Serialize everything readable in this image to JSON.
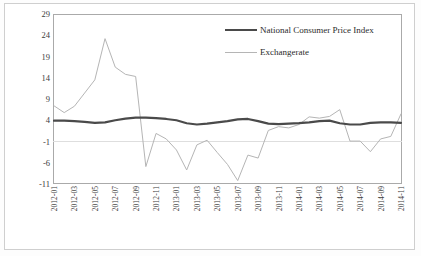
{
  "figure": {
    "background_color": "#ffffff",
    "frame_color": "#aaaaaa"
  },
  "legend": {
    "position": "top-right",
    "entries": [
      {
        "label": "National Consumer Price Index",
        "color": "#4a4a4a",
        "width": 2.2
      },
      {
        "label": "Exchangerate",
        "color": "#b5b5b5",
        "width": 1.0
      }
    ]
  },
  "chart_data": {
    "type": "line",
    "title": "",
    "subtitle": "",
    "xlabel": "",
    "ylabel": "Annual variation",
    "ylim": [
      -11,
      29
    ],
    "yticks": [
      29,
      24,
      19,
      14,
      9,
      4,
      -1,
      -6,
      -11
    ],
    "grid": "horizontal-single-at--1",
    "gridlines": [
      -1
    ],
    "legend_position": "top-right",
    "x": [
      "2012-01",
      "2012-02",
      "2012-03",
      "2012-04",
      "2012-05",
      "2012-06",
      "2012-07",
      "2012-08",
      "2012-09",
      "2012-10",
      "2012-11",
      "2012-12",
      "2013-01",
      "2013-02",
      "2013-03",
      "2013-04",
      "2013-05",
      "2013-06",
      "2013-07",
      "2013-08",
      "2013-09",
      "2013-10",
      "2013-11",
      "2013-12",
      "2014-01",
      "2014-02",
      "2014-03",
      "2014-04",
      "2014-05",
      "2014-06",
      "2014-07",
      "2014-08",
      "2014-09",
      "2014-10",
      "2014-11"
    ],
    "xticklabels": [
      "2012-01",
      "2012-03",
      "2012-05",
      "2012-07",
      "2012-09",
      "2012-11",
      "2013-01",
      "2013-03",
      "2013-05",
      "2013-07",
      "2013-09",
      "2013-11",
      "2014-01",
      "2014-03",
      "2014-05",
      "2014-07",
      "2014-09",
      "2014-11"
    ],
    "xtick_indices": [
      0,
      2,
      4,
      6,
      8,
      10,
      12,
      14,
      16,
      18,
      20,
      22,
      24,
      26,
      28,
      30,
      32,
      34
    ],
    "series": [
      {
        "name": "National Consumer Price Index",
        "color": "#4a4a4a",
        "width": 2.2,
        "values": [
          3.9,
          3.9,
          3.8,
          3.6,
          3.4,
          3.5,
          4.0,
          4.4,
          4.6,
          4.6,
          4.5,
          4.3,
          4.0,
          3.3,
          3.0,
          3.2,
          3.5,
          3.8,
          4.2,
          4.3,
          3.8,
          3.2,
          3.1,
          3.2,
          3.3,
          3.5,
          3.8,
          3.9,
          3.3,
          3.0,
          3.0,
          3.4,
          3.5,
          3.5,
          3.4
        ]
      },
      {
        "name": "Exchangerate",
        "color": "#b5b5b5",
        "width": 1.0,
        "values": [
          7.4,
          5.8,
          7.3,
          10.4,
          13.5,
          23.2,
          16.5,
          14.8,
          14.3,
          -6.9,
          0.9,
          -0.4,
          -3.0,
          -7.7,
          -1.8,
          -0.7,
          -3.6,
          -6.4,
          -10.2,
          -4.2,
          -4.9,
          1.6,
          2.5,
          2.2,
          3.0,
          4.8,
          4.5,
          4.9,
          6.5,
          -0.9,
          -0.9,
          -3.4,
          -0.4,
          0.2,
          5.5
        ]
      }
    ]
  }
}
